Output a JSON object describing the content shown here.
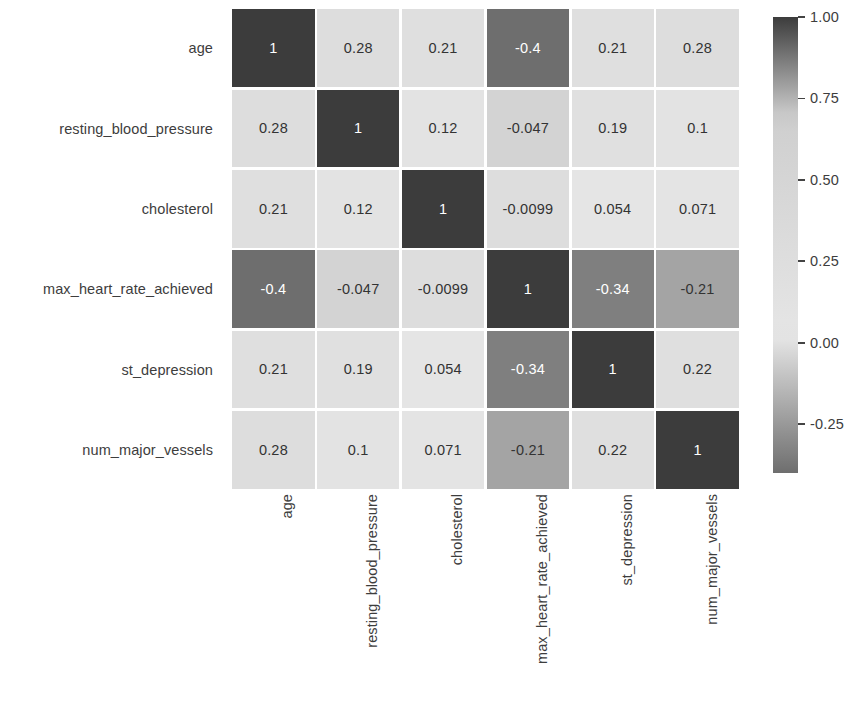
{
  "chart_data": {
    "type": "heatmap",
    "title": "",
    "xlabel": "",
    "ylabel": "",
    "grid": false,
    "legend_position": "right",
    "colormap": "grayscale",
    "annotated": true,
    "x_categories": [
      "age",
      "resting_blood_pressure",
      "cholesterol",
      "max_heart_rate_achieved",
      "st_depression",
      "num_major_vessels"
    ],
    "y_categories": [
      "age",
      "resting_blood_pressure",
      "cholesterol",
      "max_heart_rate_achieved",
      "st_depression",
      "num_major_vessels"
    ],
    "values": [
      [
        1,
        0.28,
        0.21,
        -0.4,
        0.21,
        0.28
      ],
      [
        0.28,
        1,
        0.12,
        -0.047,
        0.19,
        0.1
      ],
      [
        0.21,
        0.12,
        1,
        -0.0099,
        0.054,
        0.071
      ],
      [
        -0.4,
        -0.047,
        -0.0099,
        1,
        -0.34,
        -0.21
      ],
      [
        0.21,
        0.19,
        0.054,
        -0.34,
        1,
        0.22
      ],
      [
        0.28,
        0.1,
        0.071,
        -0.21,
        0.22,
        1
      ]
    ],
    "cell_labels": [
      [
        "1",
        "0.28",
        "0.21",
        "-0.4",
        "0.21",
        "0.28"
      ],
      [
        "0.28",
        "1",
        "0.12",
        "-0.047",
        "0.19",
        "0.1"
      ],
      [
        "0.21",
        "0.12",
        "1",
        "-0.0099",
        "0.054",
        "0.071"
      ],
      [
        "-0.4",
        "-0.047",
        "-0.0099",
        "1",
        "-0.34",
        "-0.21"
      ],
      [
        "0.21",
        "0.19",
        "0.054",
        "-0.34",
        "1",
        "0.22"
      ],
      [
        "0.28",
        "0.1",
        "0.071",
        "-0.21",
        "0.22",
        "1"
      ]
    ],
    "colorbar": {
      "vmin": -0.4,
      "vmax": 1.0,
      "tick_labels": [
        "1.00",
        "0.75",
        "0.50",
        "0.25",
        "0.00",
        "-0.25"
      ],
      "tick_values": [
        1.0,
        0.75,
        0.5,
        0.25,
        0.0,
        -0.25
      ]
    }
  },
  "colors": {
    "background": "#ffffff",
    "text": "#3d3d3d",
    "cell_text_dark": "#333333",
    "cell_text_light": "#ffffff",
    "colormap_low": "#5a5a5a",
    "colormap_high": "#3a3a3a",
    "colormap_mid": "#e8e8e8"
  }
}
